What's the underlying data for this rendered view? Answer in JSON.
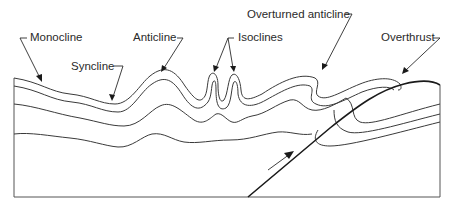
{
  "diagram": {
    "labels": {
      "monocline": "Monocline",
      "syncline": "Syncline",
      "anticline": "Anticline",
      "isoclines": "Isoclines",
      "overturned_anticline": "Overturned anticline",
      "overthrust": "Overthrust"
    },
    "colors": {
      "line": "#3a3a3a",
      "fault": "#1a1a1a",
      "background": "#ffffff"
    }
  }
}
